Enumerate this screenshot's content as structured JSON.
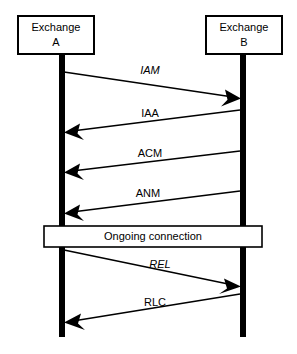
{
  "diagram": {
    "type": "sequence-diagram",
    "title": "",
    "background_color": "#ffffff",
    "line_color": "#000000",
    "participants": [
      {
        "id": "exchange-a",
        "label_line1": "Exchange",
        "label_line2": "A",
        "box": {
          "x": 18,
          "y": 16,
          "width": 76,
          "height": 38
        },
        "lifeline_x": 62,
        "lifeline_top": 54,
        "lifeline_bottom": 337
      },
      {
        "id": "exchange-b",
        "label_line1": "Exchange",
        "label_line2": "B",
        "box": {
          "x": 206,
          "y": 16,
          "width": 76,
          "height": 38
        },
        "lifeline_x": 243,
        "lifeline_top": 54,
        "lifeline_bottom": 337
      }
    ],
    "messages": [
      {
        "id": "msg-iam",
        "label": "IAM",
        "italic": true,
        "direction": "a-to-b",
        "from_x": 64,
        "from_y": 72,
        "to_x": 240,
        "to_y": 98,
        "label_x": 150,
        "label_y": 74
      },
      {
        "id": "msg-iaa",
        "label": "IAA",
        "italic": false,
        "direction": "b-to-a",
        "from_x": 240,
        "from_y": 110,
        "to_x": 65,
        "to_y": 132,
        "label_x": 150,
        "label_y": 117
      },
      {
        "id": "msg-acm",
        "label": "ACM",
        "italic": false,
        "direction": "b-to-a",
        "from_x": 240,
        "from_y": 151,
        "to_x": 65,
        "to_y": 172,
        "label_x": 150,
        "label_y": 157
      },
      {
        "id": "msg-anm",
        "label": "ANM",
        "italic": false,
        "direction": "b-to-a",
        "from_x": 240,
        "from_y": 191,
        "to_x": 65,
        "to_y": 213,
        "label_x": 148,
        "label_y": 197
      },
      {
        "id": "msg-rel",
        "label": "REL",
        "italic": true,
        "direction": "a-to-b",
        "from_x": 64,
        "from_y": 250,
        "to_x": 240,
        "to_y": 286,
        "label_x": 160,
        "label_y": 268
      },
      {
        "id": "msg-rlc",
        "label": "RLC",
        "italic": false,
        "direction": "b-to-a",
        "from_x": 240,
        "from_y": 294,
        "to_x": 65,
        "to_y": 322,
        "label_x": 155,
        "label_y": 306
      }
    ],
    "bands": [
      {
        "id": "ongoing-connection",
        "label": "Ongoing connection",
        "x": 44,
        "y": 226,
        "width": 218,
        "height": 21
      }
    ]
  }
}
